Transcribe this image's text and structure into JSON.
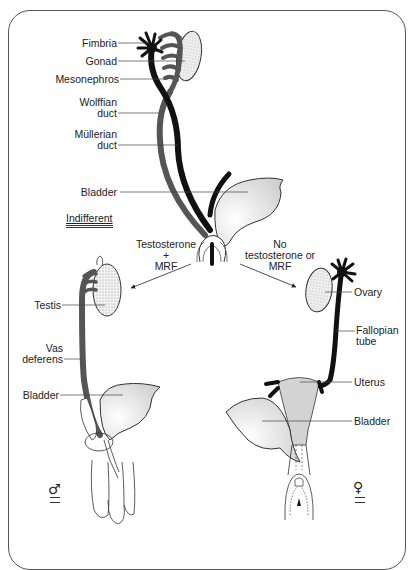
{
  "diagram": {
    "indifferent": {
      "stage_label": "Indifferent",
      "labels": {
        "fimbria": "Fimbria",
        "gonad": "Gonad",
        "mesonephros": "Mesonephros",
        "wolffian_line1": "Wolffian",
        "wolffian_line2": "duct",
        "mullerian_line1": "Müllerian",
        "mullerian_line2": "duct",
        "bladder": "Bladder"
      }
    },
    "male_path": {
      "condition_line1": "Testosterone",
      "condition_line2": "+",
      "condition_line3": "MRF"
    },
    "female_path": {
      "condition_line1": "No",
      "condition_line2": "testosterone or",
      "condition_line3": "MRF"
    },
    "male": {
      "symbol": "♂",
      "labels": {
        "testis": "Testis",
        "vas_line1": "Vas",
        "vas_line2": "deferens",
        "bladder": "Bladder"
      }
    },
    "female": {
      "symbol": "♀",
      "labels": {
        "ovary": "Ovary",
        "fallopian_line1": "Fallopian",
        "fallopian_line2": "tube",
        "uterus": "Uterus",
        "bladder": "Bladder"
      }
    },
    "colors": {
      "wolffian": "#555555",
      "mullerian": "#111111",
      "outline": "#333333",
      "stipple": "#dcdcdc"
    }
  }
}
